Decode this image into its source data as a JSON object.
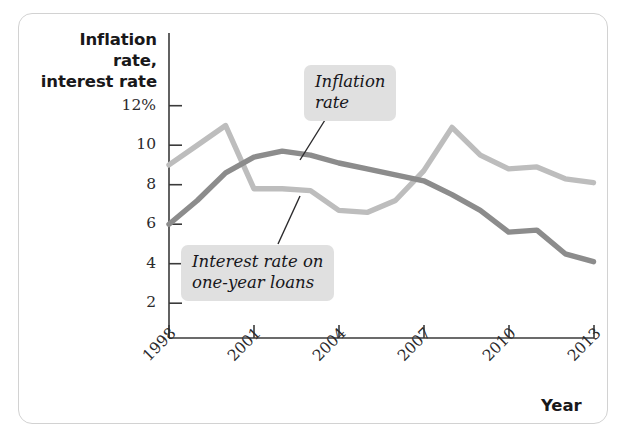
{
  "figure": {
    "background_color": "#ffffff",
    "frame_border_color": "#d2d2d2"
  },
  "chart_data": {
    "type": "line",
    "title": "",
    "subtitle": "",
    "ylabel": "Inflation rate,\ninterest rate",
    "xlabel": "Year",
    "x": [
      1998,
      1999,
      2000,
      2001,
      2002,
      2003,
      2004,
      2005,
      2006,
      2007,
      2008,
      2009,
      2010,
      2011,
      2012,
      2013
    ],
    "xtick_labels": [
      "1998",
      "2001",
      "2004",
      "2007",
      "2010",
      "2013"
    ],
    "xticks": [
      1998,
      2001,
      2004,
      2007,
      2010,
      2013
    ],
    "ytick_labels": [
      "12%",
      "10",
      "8",
      "6",
      "4",
      "2"
    ],
    "yticks": [
      12,
      10,
      8,
      6,
      4,
      2
    ],
    "ylim": [
      0,
      13
    ],
    "xlim": [
      1998,
      2013
    ],
    "grid": false,
    "legend_position": "inline-callouts",
    "series": [
      {
        "name": "Inflation rate",
        "color": "#8c8c8c",
        "line_width": 5,
        "values": [
          6.0,
          7.2,
          8.6,
          9.4,
          9.7,
          9.5,
          9.1,
          8.8,
          8.5,
          8.2,
          7.5,
          6.7,
          5.6,
          5.7,
          4.5,
          4.1
        ]
      },
      {
        "name": "Interest rate on one-year loans",
        "color": "#bdbdbd",
        "line_width": 5,
        "values": [
          9.0,
          10.0,
          11.0,
          7.8,
          7.8,
          7.7,
          6.7,
          6.6,
          7.2,
          8.7,
          10.9,
          9.5,
          8.8,
          8.9,
          8.3,
          8.1
        ]
      }
    ],
    "annotations": [
      {
        "id": "inflation-callout",
        "text": "Inflation\nrate",
        "points_to_series": "Inflation rate",
        "background": "#e0e0e0"
      },
      {
        "id": "interest-callout",
        "text": "Interest rate on\none-year loans",
        "points_to_series": "Interest rate on one-year loans",
        "background": "#e0e0e0"
      }
    ]
  }
}
